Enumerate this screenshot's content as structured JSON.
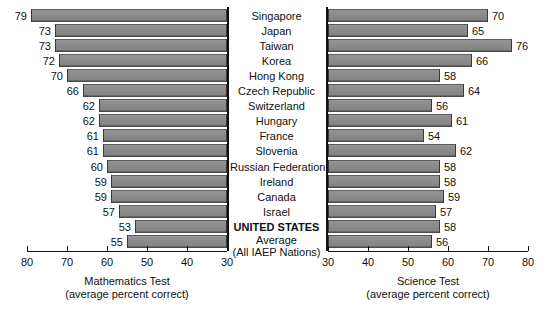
{
  "chart_data": {
    "type": "bar",
    "title": "",
    "orientation": "horizontal-diverging",
    "categories": [
      "Singapore",
      "Japan",
      "Taiwan",
      "Korea",
      "Hong Kong",
      "Czech Republic",
      "Switzerland",
      "Hungary",
      "France",
      "Slovenia",
      "Russian Federation",
      "Ireland",
      "Canada",
      "Israel",
      "UNITED STATES",
      "Average"
    ],
    "category_subtitles": {
      "Average": "(All IAEP Nations)"
    },
    "highlighted_category": "UNITED STATES",
    "series": [
      {
        "name": "Mathematics Test",
        "axis": "left",
        "xlabel": "Mathematics Test",
        "xsublabel": "(average percent correct)",
        "xlim": [
          80,
          30
        ],
        "xticks": [
          80,
          70,
          60,
          50,
          40,
          30
        ],
        "values": [
          79,
          73,
          73,
          72,
          70,
          66,
          62,
          62,
          61,
          61,
          60,
          59,
          59,
          57,
          53,
          55
        ]
      },
      {
        "name": "Science Test",
        "axis": "right",
        "xlabel": "Science Test",
        "xsublabel": "(average percent correct)",
        "xlim": [
          30,
          80
        ],
        "xticks": [
          30,
          40,
          50,
          60,
          70,
          80
        ],
        "values": [
          70,
          65,
          76,
          66,
          58,
          64,
          56,
          61,
          54,
          62,
          58,
          58,
          59,
          57,
          58,
          56
        ]
      }
    ],
    "grid": false,
    "legend": "none",
    "colors": {
      "bar_fill": "#8b8b8b",
      "bar_edge": "#3a3a3a",
      "axis": "#111111",
      "background": "#ffffff"
    }
  },
  "left_axis": {
    "tick_labels": [
      "80",
      "70",
      "60",
      "50",
      "40",
      "30"
    ],
    "title": "Mathematics Test",
    "subtitle": "(average percent correct)"
  },
  "right_axis": {
    "tick_labels": [
      "30",
      "40",
      "50",
      "60",
      "70",
      "80"
    ],
    "title": "Science Test",
    "subtitle": "(average percent correct)"
  },
  "rows": [
    {
      "label": "Singapore",
      "sub": "",
      "math": "79",
      "science": "70",
      "bold": false
    },
    {
      "label": "Japan",
      "sub": "",
      "math": "73",
      "science": "65",
      "bold": false
    },
    {
      "label": "Taiwan",
      "sub": "",
      "math": "73",
      "science": "76",
      "bold": false
    },
    {
      "label": "Korea",
      "sub": "",
      "math": "72",
      "science": "66",
      "bold": false
    },
    {
      "label": "Hong Kong",
      "sub": "",
      "math": "70",
      "science": "58",
      "bold": false
    },
    {
      "label": "Czech Republic",
      "sub": "",
      "math": "66",
      "science": "64",
      "bold": false
    },
    {
      "label": "Switzerland",
      "sub": "",
      "math": "62",
      "science": "56",
      "bold": false
    },
    {
      "label": "Hungary",
      "sub": "",
      "math": "62",
      "science": "61",
      "bold": false
    },
    {
      "label": "France",
      "sub": "",
      "math": "61",
      "science": "54",
      "bold": false
    },
    {
      "label": "Slovenia",
      "sub": "",
      "math": "61",
      "science": "62",
      "bold": false
    },
    {
      "label": "Russian Federation",
      "sub": "",
      "math": "60",
      "science": "58",
      "bold": false
    },
    {
      "label": "Ireland",
      "sub": "",
      "math": "59",
      "science": "58",
      "bold": false
    },
    {
      "label": "Canada",
      "sub": "",
      "math": "59",
      "science": "59",
      "bold": false
    },
    {
      "label": "Israel",
      "sub": "",
      "math": "57",
      "science": "57",
      "bold": false
    },
    {
      "label": "UNITED STATES",
      "sub": "",
      "math": "53",
      "science": "58",
      "bold": true
    },
    {
      "label": "Average",
      "sub": "(All IAEP Nations)",
      "math": "55",
      "science": "56",
      "bold": false
    }
  ]
}
